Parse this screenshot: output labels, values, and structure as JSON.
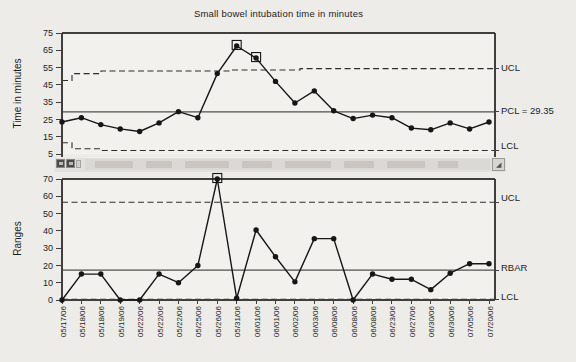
{
  "title": "Small bowel intubation time in minutes",
  "colors": {
    "background": "#eeece9",
    "plot_bg": "#f3f1ee",
    "frame": "#413f3d",
    "data_line": "#161616",
    "limit_dash": "#2e2e2e",
    "limit_dash_muted": "#908e8a",
    "center_line": "#4f4f4f",
    "text": "#1c1c1c"
  },
  "categories": [
    "05/17/06",
    "05/18/06",
    "05/18/06",
    "05/19/06",
    "05/22/06",
    "05/22/06",
    "05/22/06",
    "05/25/06",
    "05/26/06",
    "05/31/06",
    "06/01/06",
    "06/01/06",
    "06/02/06",
    "06/03/06",
    "06/08/06",
    "06/08/06",
    "06/08/06",
    "06/23/06",
    "06/27/06",
    "06/30/06",
    "06/30/06",
    "07/05/06",
    "07/20/06"
  ],
  "chart_data": [
    {
      "type": "line",
      "name": "xbar-chart",
      "title": "Small bowel intubation time in minutes",
      "xlabel": "",
      "ylabel": "Time in minutes",
      "ylim": [
        5,
        75
      ],
      "yticks": [
        75,
        65,
        55,
        45,
        35,
        25,
        15,
        5
      ],
      "grid": false,
      "categories": [
        "05/17/06",
        "05/18/06",
        "05/18/06",
        "05/19/06",
        "05/22/06",
        "05/22/06",
        "05/22/06",
        "05/25/06",
        "05/26/06",
        "05/31/06",
        "06/01/06",
        "06/01/06",
        "06/02/06",
        "06/03/06",
        "06/08/06",
        "06/08/06",
        "06/08/06",
        "06/23/06",
        "06/27/06",
        "06/30/06",
        "06/30/06",
        "07/05/06",
        "07/20/06"
      ],
      "values": [
        23.5,
        26,
        22,
        19.5,
        18,
        23,
        29.5,
        26,
        51.5,
        67.5,
        60.5,
        47,
        34.5,
        41.5,
        30,
        25.5,
        27.5,
        26,
        20,
        19,
        23,
        19.5,
        23.5
      ],
      "flagged_indices": [
        9,
        10
      ],
      "center_line": {
        "label": "PCL = 29.35",
        "value": 29.35
      },
      "ucl": {
        "label": "UCL",
        "vertices": [
          [
            0,
            47.5
          ],
          [
            0.023,
            47.5
          ],
          [
            0.023,
            51.5
          ],
          [
            0.09,
            51.5
          ],
          [
            0.09,
            53
          ],
          [
            0.39,
            53
          ],
          [
            0.39,
            53.6
          ],
          [
            0.55,
            53.6
          ],
          [
            0.55,
            54.4
          ],
          [
            1,
            54.4
          ]
        ]
      },
      "lcl": {
        "label": "LCL",
        "vertices": [
          [
            0,
            11.5
          ],
          [
            0.023,
            11.5
          ],
          [
            0.023,
            8
          ],
          [
            0.09,
            8
          ],
          [
            0.09,
            7
          ],
          [
            1,
            7
          ]
        ]
      }
    },
    {
      "type": "line",
      "name": "range-chart",
      "title": "",
      "xlabel": "",
      "ylabel": "Ranges",
      "ylim": [
        0,
        70
      ],
      "yticks": [
        70,
        60,
        50,
        40,
        30,
        20,
        10,
        0
      ],
      "grid": false,
      "categories": [
        "05/17/06",
        "05/18/06",
        "05/18/06",
        "05/19/06",
        "05/22/06",
        "05/22/06",
        "05/22/06",
        "05/25/06",
        "05/26/06",
        "05/31/06",
        "06/01/06",
        "06/01/06",
        "06/02/06",
        "06/03/06",
        "06/08/06",
        "06/08/06",
        "06/08/06",
        "06/23/06",
        "06/27/06",
        "06/30/06",
        "06/30/06",
        "07/05/06",
        "07/20/06"
      ],
      "values": [
        0,
        15,
        15,
        0,
        0,
        15,
        10,
        20,
        70,
        1,
        40.5,
        25,
        10.5,
        35.5,
        35.5,
        0,
        15,
        12,
        12,
        6,
        15.5,
        21,
        21
      ],
      "flagged_indices": [
        8
      ],
      "center_line": {
        "label": "RBAR",
        "value": 17.3
      },
      "ucl": {
        "label": "UCL",
        "vertices": [
          [
            0,
            56.5
          ],
          [
            1,
            56.5
          ]
        ]
      },
      "lcl": {
        "label": "LCL",
        "vertices": [
          [
            0,
            0.5
          ],
          [
            1,
            0.5
          ]
        ],
        "muted": true
      }
    }
  ],
  "scrollbar": {
    "right_arrow_icon": "◢"
  }
}
